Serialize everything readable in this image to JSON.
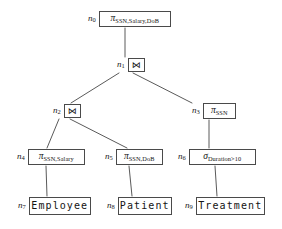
{
  "diagram": {
    "background": "#ffffff",
    "line_color": "#5a5a5a",
    "box_border_color": "#4a4a4a",
    "text_color": "#141414"
  },
  "nodes": {
    "n0": {
      "id": "n0",
      "label": "n",
      "index": "0",
      "kind": "projection",
      "operator": "π",
      "subscript": "SSN,Salary,DoB",
      "text": "πSSN,Salary,DoB"
    },
    "n1": {
      "id": "n1",
      "label": "n",
      "index": "1",
      "kind": "join",
      "operator": "⋈",
      "subscript": "",
      "text": "⋈"
    },
    "n2": {
      "id": "n2",
      "label": "n",
      "index": "2",
      "kind": "join",
      "operator": "⋈",
      "subscript": "",
      "text": "⋈"
    },
    "n3": {
      "id": "n3",
      "label": "n",
      "index": "3",
      "kind": "projection",
      "operator": "π",
      "subscript": "SSN",
      "text": "πSSN"
    },
    "n4": {
      "id": "n4",
      "label": "n",
      "index": "4",
      "kind": "projection",
      "operator": "π",
      "subscript": "SSN,Salary",
      "text": "πSSN,Salary"
    },
    "n5": {
      "id": "n5",
      "label": "n",
      "index": "5",
      "kind": "projection",
      "operator": "π",
      "subscript": "SSN,DoB",
      "text": "πSSN,DoB"
    },
    "n6": {
      "id": "n6",
      "label": "n",
      "index": "6",
      "kind": "selection",
      "operator": "σ",
      "subscript": "Duration>10",
      "text": "σDuration>10"
    },
    "n7": {
      "id": "n7",
      "label": "n",
      "index": "7",
      "kind": "relation",
      "operator": "",
      "subscript": "",
      "text": "Employee"
    },
    "n8": {
      "id": "n8",
      "label": "n",
      "index": "8",
      "kind": "relation",
      "operator": "",
      "subscript": "",
      "text": "Patient"
    },
    "n9": {
      "id": "n9",
      "label": "n",
      "index": "9",
      "kind": "relation",
      "operator": "",
      "subscript": "",
      "text": "Treatment"
    }
  },
  "edges": [
    {
      "from": "n0",
      "to": "n1"
    },
    {
      "from": "n1",
      "to": "n2"
    },
    {
      "from": "n1",
      "to": "n3"
    },
    {
      "from": "n2",
      "to": "n4"
    },
    {
      "from": "n2",
      "to": "n5"
    },
    {
      "from": "n3",
      "to": "n6"
    },
    {
      "from": "n4",
      "to": "n7"
    },
    {
      "from": "n5",
      "to": "n8"
    },
    {
      "from": "n6",
      "to": "n9"
    }
  ]
}
